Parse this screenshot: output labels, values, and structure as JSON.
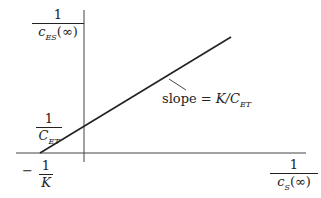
{
  "diagram": {
    "type": "lineweaver-burk-style plot",
    "y_axis_label": {
      "numerator": "1",
      "denominator_base": "c",
      "denominator_sub": "ES",
      "denominator_tail": "(∞)"
    },
    "x_axis_label": {
      "numerator": "1",
      "denominator_base": "c",
      "denominator_sub": "S",
      "denominator_tail": "(∞)"
    },
    "y_intercept_label": {
      "numerator": "1",
      "denominator_base": "C",
      "denominator_sub": "ET"
    },
    "x_intercept_label": {
      "sign": "−",
      "numerator": "1",
      "denominator": "K"
    },
    "slope_label": {
      "prefix": "slope = ",
      "base": "K/C",
      "sub": "ET"
    },
    "colors": {
      "stroke": "#222222",
      "axis": "#444444",
      "background": "#ffffff"
    }
  }
}
